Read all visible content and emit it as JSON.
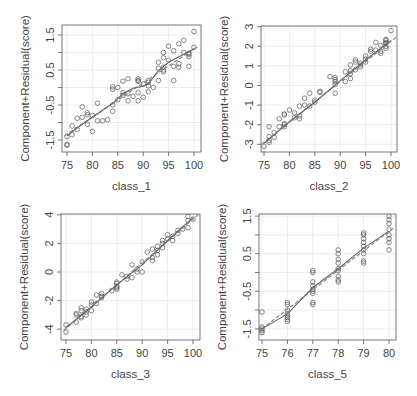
{
  "figure": {
    "layout": "2x2",
    "type": "component-plus-residual plots"
  },
  "chart_data": [
    {
      "type": "scatter",
      "title": "",
      "xlabel": "class_1",
      "ylabel": "Component+Residual(score)",
      "xlim": [
        74.5,
        101
      ],
      "ylim": [
        -1.85,
        1.85
      ],
      "xticks": [
        75,
        80,
        85,
        90,
        95,
        100
      ],
      "xtick_labels": [
        "75",
        "80",
        "85",
        "90",
        "95",
        "100"
      ],
      "yticks": [
        -1.5,
        -1,
        -0.5,
        0,
        0.5,
        1,
        1.5
      ],
      "ytick_labels": [
        "-1.5",
        "",
        "-0.5",
        "",
        "0.5",
        "",
        "1.5"
      ],
      "grid": true,
      "box": {
        "left": 62,
        "top": 25,
        "right": 201,
        "bottom": 152
      },
      "px": {
        "x0": 67,
        "xscale": 5.08,
        "y0": 87.5,
        "yscale": 35
      },
      "fit_line": {
        "x": [
          74.5,
          101
        ],
        "y": [
          -1.38,
          1.2
        ]
      },
      "smooth": {
        "x": [
          75,
          78,
          81,
          84,
          86,
          88,
          90,
          91,
          93,
          95,
          97,
          100
        ],
        "y": [
          -1.38,
          -1.05,
          -0.75,
          -0.45,
          -0.18,
          -0.02,
          0.04,
          0.1,
          0.48,
          0.72,
          0.88,
          1.1
        ]
      },
      "points": [
        [
          75,
          -1.65
        ],
        [
          75,
          -1.62
        ],
        [
          75,
          -1.4
        ],
        [
          76,
          -1.35
        ],
        [
          76,
          -1.1
        ],
        [
          77,
          -1.2
        ],
        [
          77,
          -0.88
        ],
        [
          78,
          -0.85
        ],
        [
          78,
          -0.55
        ],
        [
          79,
          -0.78
        ],
        [
          79,
          -0.72
        ],
        [
          79,
          -1.05
        ],
        [
          80,
          -0.8
        ],
        [
          80,
          -1.25
        ],
        [
          81,
          -0.95
        ],
        [
          81,
          -0.45
        ],
        [
          82,
          -0.95
        ],
        [
          83,
          -0.92
        ],
        [
          84,
          -0.68
        ],
        [
          84,
          -0.5
        ],
        [
          84,
          0.02
        ],
        [
          84,
          -0.05
        ],
        [
          85,
          0.0
        ],
        [
          85,
          -0.35
        ],
        [
          86,
          -0.22
        ],
        [
          86,
          0.18
        ],
        [
          86,
          -0.15
        ],
        [
          87,
          -0.18
        ],
        [
          87,
          0.25
        ],
        [
          87,
          -0.38
        ],
        [
          88,
          -0.25
        ],
        [
          89,
          0.25
        ],
        [
          89,
          0.2
        ],
        [
          89,
          0.18
        ],
        [
          89,
          -0.15
        ],
        [
          89,
          -0.38
        ],
        [
          90,
          0.1
        ],
        [
          90,
          -0.28
        ],
        [
          91,
          0.15
        ],
        [
          91,
          0.05
        ],
        [
          91,
          -0.12
        ],
        [
          91,
          0.2
        ],
        [
          92,
          0.0
        ],
        [
          93,
          0.2
        ],
        [
          93,
          0.55
        ],
        [
          93,
          0.72
        ],
        [
          94,
          0.5
        ],
        [
          94,
          0.58
        ],
        [
          94,
          1.0
        ],
        [
          94,
          0.85
        ],
        [
          94,
          0.45
        ],
        [
          95,
          0.78
        ],
        [
          95,
          1.18
        ],
        [
          96,
          0.6
        ],
        [
          96,
          1.05
        ],
        [
          96,
          0.2
        ],
        [
          97,
          0.58
        ],
        [
          97,
          0.68
        ],
        [
          97,
          1.25
        ],
        [
          98,
          1.0
        ],
        [
          98,
          1.35
        ],
        [
          99,
          0.98
        ],
        [
          99,
          0.95
        ],
        [
          99,
          0.88
        ],
        [
          99,
          0.6
        ],
        [
          100,
          1.6
        ],
        [
          100,
          1.15
        ]
      ]
    },
    {
      "type": "scatter",
      "title": "",
      "xlabel": "class_2",
      "ylabel": "Component+Residual(score)",
      "xlim": [
        74.5,
        101
      ],
      "ylim": [
        -3.35,
        3.1
      ],
      "xticks": [
        75,
        80,
        85,
        90,
        95,
        100
      ],
      "xtick_labels": [
        "75",
        "80",
        "85",
        "90",
        "95",
        "100"
      ],
      "yticks": [
        -3,
        -2,
        -1,
        0,
        1,
        2,
        3
      ],
      "ytick_labels": [
        "-3",
        "-2",
        "-1",
        "0",
        "1",
        "2",
        "3"
      ],
      "grid": true,
      "box": {
        "left": 261,
        "top": 26,
        "right": 397,
        "bottom": 152
      },
      "px": {
        "x0": 264,
        "xscale": 5.08,
        "y0": 85.5,
        "yscale": 19.6
      },
      "fit_line": {
        "x": [
          74.5,
          101
        ],
        "y": [
          -3.0,
          2.45
        ]
      },
      "smooth": {
        "x": [
          75,
          80,
          85,
          90,
          95,
          100
        ],
        "y": [
          -2.95,
          -1.85,
          -0.85,
          0.25,
          1.3,
          2.3
        ]
      },
      "points": [
        [
          75,
          -3.1
        ],
        [
          76,
          -2.9
        ],
        [
          76,
          -2.8
        ],
        [
          76,
          -2.6
        ],
        [
          76,
          -2.1
        ],
        [
          77,
          -2.65
        ],
        [
          77,
          -2.4
        ],
        [
          78,
          -2.1
        ],
        [
          78,
          -1.7
        ],
        [
          79,
          -2.0
        ],
        [
          79,
          -1.95
        ],
        [
          79,
          -1.5
        ],
        [
          79,
          -1.45
        ],
        [
          79,
          -2.1
        ],
        [
          80,
          -1.25
        ],
        [
          81,
          -1.65
        ],
        [
          81,
          -1.4
        ],
        [
          82,
          -1.55
        ],
        [
          82,
          -1.05
        ],
        [
          82,
          -1.7
        ],
        [
          83,
          -0.65
        ],
        [
          83,
          -1.0
        ],
        [
          84,
          -1.05
        ],
        [
          84,
          -0.4
        ],
        [
          85,
          -0.75
        ],
        [
          85,
          -0.85
        ],
        [
          86,
          -0.3
        ],
        [
          86,
          -0.35
        ],
        [
          88,
          0.45
        ],
        [
          89,
          0.4
        ],
        [
          89,
          0.3
        ],
        [
          89,
          0.05
        ],
        [
          89,
          -0.4
        ],
        [
          89,
          0.2
        ],
        [
          91,
          0.7
        ],
        [
          91,
          0.2
        ],
        [
          92,
          0.6
        ],
        [
          92,
          0.75
        ],
        [
          92,
          1.05
        ],
        [
          92,
          0.35
        ],
        [
          93,
          1.3
        ],
        [
          93,
          1.2
        ],
        [
          93,
          0.8
        ],
        [
          94,
          1.05
        ],
        [
          94,
          1.15
        ],
        [
          94,
          0.95
        ],
        [
          95,
          1.2
        ],
        [
          95,
          1.5
        ],
        [
          95,
          1.35
        ],
        [
          96,
          1.85
        ],
        [
          96,
          1.75
        ],
        [
          97,
          2.2
        ],
        [
          97,
          1.8
        ],
        [
          98,
          1.65
        ],
        [
          98,
          2.05
        ],
        [
          98,
          1.75
        ],
        [
          99,
          2.35
        ],
        [
          99,
          2.2
        ],
        [
          99,
          2.15
        ],
        [
          99,
          2.0
        ],
        [
          99,
          1.9
        ],
        [
          99,
          2.3
        ],
        [
          100,
          2.8
        ]
      ]
    },
    {
      "type": "scatter",
      "title": "",
      "xlabel": "class_3",
      "ylabel": "Component+Residual(score)",
      "xlim": [
        74.5,
        101
      ],
      "ylim": [
        -4.4,
        4.1
      ],
      "xticks": [
        75,
        80,
        85,
        90,
        95,
        100
      ],
      "xtick_labels": [
        "75",
        "80",
        "85",
        "90",
        "95",
        "100"
      ],
      "yticks": [
        -4,
        -2,
        0,
        2,
        4
      ],
      "ytick_labels": [
        "-4",
        "-2",
        "0",
        "2",
        "4"
      ],
      "grid": true,
      "box": {
        "left": 61,
        "top": 214,
        "right": 200,
        "bottom": 340
      },
      "px": {
        "x0": 66,
        "xscale": 5.08,
        "y0": 272,
        "yscale": 14.3
      },
      "fit_line": {
        "x": [
          74.5,
          101
        ],
        "y": [
          -4.1,
          4.0
        ]
      },
      "smooth": {
        "x": [
          75,
          80,
          85,
          90,
          95,
          100
        ],
        "y": [
          -3.9,
          -2.45,
          -0.9,
          0.5,
          2.2,
          3.8
        ]
      },
      "points": [
        [
          75,
          -4.2
        ],
        [
          75,
          -3.7
        ],
        [
          77,
          -3.5
        ],
        [
          77,
          -3.0
        ],
        [
          77,
          -2.9
        ],
        [
          78,
          -3.2
        ],
        [
          78,
          -3.1
        ],
        [
          78,
          -2.7
        ],
        [
          78,
          -2.5
        ],
        [
          79,
          -3.0
        ],
        [
          79,
          -2.8
        ],
        [
          79,
          -2.6
        ],
        [
          80,
          -2.7
        ],
        [
          80,
          -2.1
        ],
        [
          80,
          -2.3
        ],
        [
          81,
          -2.2
        ],
        [
          81,
          -1.6
        ],
        [
          82,
          -1.8
        ],
        [
          82,
          -1.5
        ],
        [
          82,
          -1.7
        ],
        [
          84,
          -1.3
        ],
        [
          85,
          -1.2
        ],
        [
          85,
          -1.0
        ],
        [
          85,
          -0.8
        ],
        [
          85,
          -0.7
        ],
        [
          85,
          -1.1
        ],
        [
          86,
          -0.2
        ],
        [
          87,
          -0.5
        ],
        [
          87,
          -0.3
        ],
        [
          88,
          0.5
        ],
        [
          88,
          -0.4
        ],
        [
          89,
          0.2
        ],
        [
          89,
          0.0
        ],
        [
          90,
          0.7
        ],
        [
          90,
          0.0
        ],
        [
          91,
          1.4
        ],
        [
          92,
          1.0
        ],
        [
          92,
          0.8
        ],
        [
          92,
          1.6
        ],
        [
          93,
          1.8
        ],
        [
          93,
          1.5
        ],
        [
          93,
          1.2
        ],
        [
          94,
          1.7
        ],
        [
          94,
          2.0
        ],
        [
          94,
          2.2
        ],
        [
          95,
          2.3
        ],
        [
          95,
          2.6
        ],
        [
          96,
          2.5
        ],
        [
          96,
          2.2
        ],
        [
          97,
          2.7
        ],
        [
          97,
          2.9
        ],
        [
          98,
          3.0
        ],
        [
          99,
          3.9
        ],
        [
          99,
          3.6
        ],
        [
          99,
          3.1
        ],
        [
          100,
          3.7
        ]
      ]
    },
    {
      "type": "scatter",
      "title": "",
      "xlabel": "class_5",
      "ylabel": "Component+Residual(score)",
      "xlim": [
        74.8,
        80.2
      ],
      "ylim": [
        -1.7,
        1.55
      ],
      "xticks": [
        75,
        76,
        77,
        78,
        79,
        80
      ],
      "xtick_labels": [
        "75",
        "76",
        "77",
        "78",
        "79",
        "80"
      ],
      "yticks": [
        -1.5,
        -1,
        -0.5,
        0,
        0.5,
        1,
        1.5
      ],
      "ytick_labels": [
        "-1.5",
        "",
        "-0.5",
        "",
        "0.5",
        "",
        "1.5"
      ],
      "grid": true,
      "box": {
        "left": 259,
        "top": 214,
        "right": 396,
        "bottom": 340
      },
      "px": {
        "x0": 262,
        "xscale": 25.4,
        "y0": 272.5,
        "yscale": 37.6
      },
      "fit_line": {
        "x": [
          74.8,
          80.2
        ],
        "y": [
          -1.6,
          1.2
        ]
      },
      "smooth": {
        "x": [
          75,
          76,
          77,
          78,
          79,
          80
        ],
        "y": [
          -1.5,
          -1.1,
          -0.4,
          0.1,
          0.65,
          1.1
        ]
      },
      "points": [
        [
          75,
          -1.5
        ],
        [
          75,
          -1.55
        ],
        [
          75,
          -1.6
        ],
        [
          75,
          -1.45
        ],
        [
          75,
          -1.05
        ],
        [
          76,
          -0.8
        ],
        [
          76,
          -0.85
        ],
        [
          76,
          -1.1
        ],
        [
          76,
          -1.15
        ],
        [
          76,
          -1.2
        ],
        [
          76,
          -1.25
        ],
        [
          76,
          -1.3
        ],
        [
          76,
          -1.0
        ],
        [
          77,
          0.05
        ],
        [
          77,
          0.0
        ],
        [
          77,
          -0.25
        ],
        [
          77,
          -0.35
        ],
        [
          77,
          -0.45
        ],
        [
          77,
          -0.5
        ],
        [
          77,
          -0.55
        ],
        [
          77,
          -0.85
        ],
        [
          77,
          -0.8
        ],
        [
          78,
          0.6
        ],
        [
          78,
          0.5
        ],
        [
          78,
          0.35
        ],
        [
          78,
          0.25
        ],
        [
          78,
          0.1
        ],
        [
          78,
          0.05
        ],
        [
          78,
          -0.1
        ],
        [
          78,
          -0.2
        ],
        [
          78,
          -0.25
        ],
        [
          79,
          1.05
        ],
        [
          79,
          1.0
        ],
        [
          79,
          0.9
        ],
        [
          79,
          0.8
        ],
        [
          79,
          0.7
        ],
        [
          79,
          0.6
        ],
        [
          79,
          0.5
        ],
        [
          79,
          0.3
        ],
        [
          79,
          0.25
        ],
        [
          80,
          1.5
        ],
        [
          80,
          1.4
        ],
        [
          80,
          1.3
        ],
        [
          80,
          1.15
        ],
        [
          80,
          1.0
        ],
        [
          80,
          0.9
        ],
        [
          80,
          0.8
        ],
        [
          80,
          0.6
        ]
      ]
    }
  ]
}
